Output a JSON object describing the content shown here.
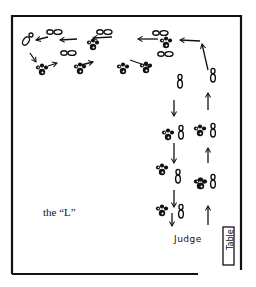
{
  "diagram": {
    "title": "the “L”",
    "judge_label": "Judge",
    "table_label": "Table",
    "ink_color": "#111111",
    "background": "#ffffff",
    "ring_border": {
      "left": 12,
      "top": 16,
      "right": 241,
      "bottom": 274,
      "bottom_gap_start": 198
    },
    "paw_prints": [
      {
        "x": 42,
        "y": 70
      },
      {
        "x": 80,
        "y": 69
      },
      {
        "x": 93,
        "y": 45
      },
      {
        "x": 123,
        "y": 69
      },
      {
        "x": 166,
        "y": 43
      },
      {
        "x": 146,
        "y": 68
      },
      {
        "x": 168,
        "y": 135
      },
      {
        "x": 200,
        "y": 131
      },
      {
        "x": 162,
        "y": 170
      },
      {
        "x": 200,
        "y": 184
      },
      {
        "x": 162,
        "y": 211
      },
      {
        "x": 201,
        "y": 184
      }
    ],
    "feet": [
      {
        "x": 26,
        "y": 41,
        "dir": "diag"
      },
      {
        "x": 54,
        "y": 32,
        "dir": "h"
      },
      {
        "x": 104,
        "y": 32,
        "dir": "h"
      },
      {
        "x": 68,
        "y": 53,
        "dir": "h"
      },
      {
        "x": 160,
        "y": 33,
        "dir": "h"
      },
      {
        "x": 165,
        "y": 54,
        "dir": "h"
      },
      {
        "x": 180,
        "y": 82,
        "dir": "v"
      },
      {
        "x": 213,
        "y": 76,
        "dir": "v"
      },
      {
        "x": 181,
        "y": 133,
        "dir": "v"
      },
      {
        "x": 213,
        "y": 131,
        "dir": "v"
      },
      {
        "x": 178,
        "y": 177,
        "dir": "v"
      },
      {
        "x": 213,
        "y": 182,
        "dir": "v"
      },
      {
        "x": 181,
        "y": 212,
        "dir": "v"
      }
    ],
    "arrows": [
      {
        "from": [
          48,
          37
        ],
        "to": [
          36,
          40
        ]
      },
      {
        "from": [
          77,
          39
        ],
        "to": [
          60,
          40
        ]
      },
      {
        "from": [
          112,
          37
        ],
        "to": [
          93,
          38
        ]
      },
      {
        "from": [
          158,
          39
        ],
        "to": [
          138,
          39
        ]
      },
      {
        "from": [
          200,
          41
        ],
        "to": [
          180,
          40
        ]
      },
      {
        "from": [
          30,
          53
        ],
        "to": [
          36,
          62
        ]
      },
      {
        "from": [
          48,
          66
        ],
        "to": [
          57,
          63
        ]
      },
      {
        "from": [
          81,
          65
        ],
        "to": [
          93,
          62
        ]
      },
      {
        "from": [
          130,
          60
        ],
        "to": [
          150,
          67
        ]
      },
      {
        "from": [
          208,
          70
        ],
        "to": [
          202,
          44
        ]
      },
      {
        "from": [
          174,
          100
        ],
        "to": [
          174,
          116
        ]
      },
      {
        "from": [
          208,
          110
        ],
        "to": [
          208,
          93
        ]
      },
      {
        "from": [
          174,
          143
        ],
        "to": [
          174,
          163
        ]
      },
      {
        "from": [
          208,
          163
        ],
        "to": [
          208,
          148
        ]
      },
      {
        "from": [
          174,
          190
        ],
        "to": [
          174,
          207
        ]
      },
      {
        "from": [
          172,
          213
        ],
        "to": [
          172,
          226
        ]
      },
      {
        "from": [
          208,
          225
        ],
        "to": [
          208,
          206
        ]
      }
    ]
  }
}
